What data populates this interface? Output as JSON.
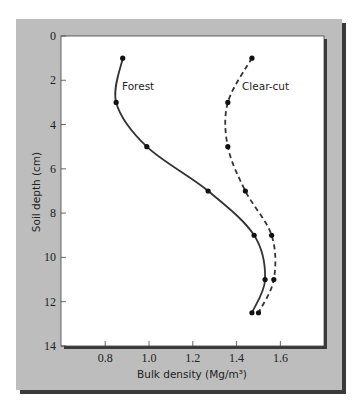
{
  "chart_data": {
    "type": "line",
    "title": "",
    "xlabel": "Bulk density (Mg/m³)",
    "ylabel": "Soil depth (cm)",
    "xlim": [
      0.6,
      1.81
    ],
    "ylim": [
      14,
      0
    ],
    "y_inverted": true,
    "x_ticks": [
      0.8,
      1.0,
      1.2,
      1.4,
      1.6
    ],
    "x_tick_labels": [
      "0.8",
      "1.0",
      "1.2",
      "1.4",
      "1.6"
    ],
    "y_ticks": [
      0,
      2,
      4,
      6,
      8,
      10,
      12,
      14
    ],
    "y_tick_labels": [
      "0",
      "2",
      "4",
      "6",
      "8",
      "10",
      "12",
      "14"
    ],
    "grid": false,
    "legend": "inline labels",
    "series": [
      {
        "name": "Forest",
        "style": "solid",
        "points": [
          {
            "x": 0.88,
            "y": 1
          },
          {
            "x": 0.85,
            "y": 3
          },
          {
            "x": 0.99,
            "y": 5
          },
          {
            "x": 1.27,
            "y": 7
          },
          {
            "x": 1.48,
            "y": 9
          },
          {
            "x": 1.53,
            "y": 11
          },
          {
            "x": 1.47,
            "y": 12.5
          }
        ]
      },
      {
        "name": "Clear-cut",
        "style": "dashed",
        "points": [
          {
            "x": 1.47,
            "y": 1
          },
          {
            "x": 1.36,
            "y": 3
          },
          {
            "x": 1.36,
            "y": 5
          },
          {
            "x": 1.44,
            "y": 7
          },
          {
            "x": 1.56,
            "y": 9
          },
          {
            "x": 1.57,
            "y": 11
          },
          {
            "x": 1.5,
            "y": 12.5
          }
        ]
      }
    ]
  },
  "colors": {
    "panel": "#bdbdbd",
    "shadow": "#3a3a3a",
    "plot_bg": "#ffffff",
    "line": "#333333"
  }
}
